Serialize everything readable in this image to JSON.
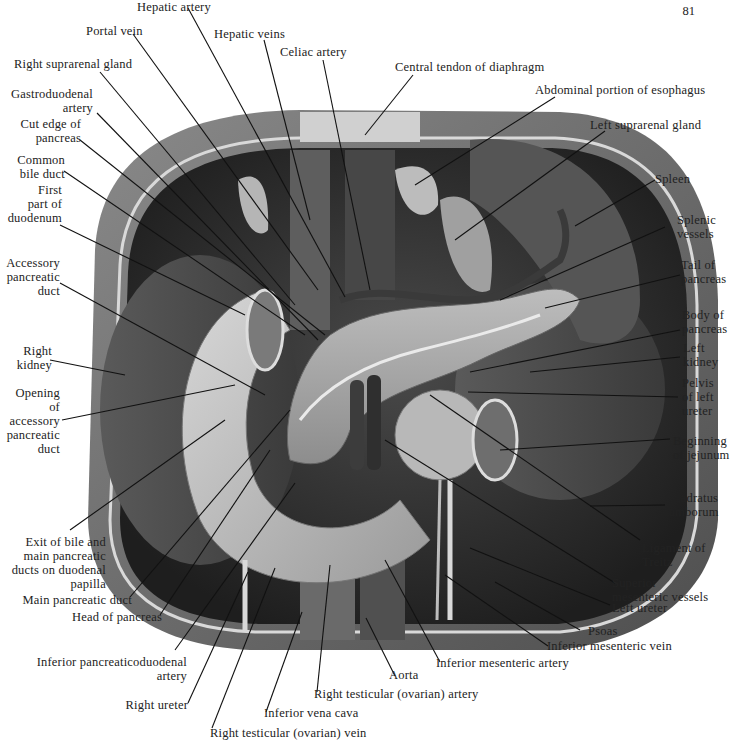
{
  "page": {
    "number": "81"
  },
  "figure": {
    "type": "anatomical-illustration",
    "colors": {
      "background": "#ffffff",
      "outer_muscle": "#6e6e6e",
      "cavity_dark": "#2e2e2e",
      "organ_mid": "#8a8a8a",
      "organ_light": "#c8c8c8",
      "leader_line": "#111111",
      "label_text": "#222222"
    }
  },
  "labels": {
    "hepatic_artery": "Hepatic artery",
    "portal_vein": "Portal vein",
    "hepatic_veins": "Hepatic veins",
    "celiac_artery": "Celiac artery",
    "right_suprarenal_gland": "Right suprarenal gland",
    "central_tendon": "Central tendon of diaphragm",
    "gastroduodenal_artery": "Gastroduodenal\nartery",
    "abdominal_esophagus": "Abdominal portion of esophagus",
    "cut_edge_pancreas": "Cut edge of\npancreas",
    "left_suprarenal_gland": "Left suprarenal gland",
    "common_bile_duct": "Common\nbile duct",
    "first_part_duodenum": "First\npart of\nduodenum",
    "spleen": "Spleen",
    "splenic_vessels": "Splenic\nvessels",
    "accessory_pancreatic_duct": "Accessory\npancreatic\nduct",
    "tail_of_pancreas": "Tail of\npancreas",
    "body_of_pancreas": "Body of\npancreas",
    "right_kidney": "Right\nkidney",
    "left_kidney": "Left\nkidney",
    "opening_accessory_duct": "Opening\nof\naccessory\npancreatic\nduct",
    "pelvis_left_ureter": "Pelvis\nof left\nureter",
    "beginning_jejunum": "Beginning\nof jejunum",
    "quadratus_lumborum": "Quadratus\nlumborum",
    "exit_bile_ducts": "Exit of bile and\nmain pancreatic\nducts on duodenal\npapilla",
    "ligament_treitz": "Ligament of\nTreitz",
    "main_pancreatic_duct": "Main pancreatic duct",
    "superior_mesenteric_vessels": "Superior\nmesenteric vessels",
    "head_of_pancreas": "Head of pancreas",
    "left_ureter": "Left ureter",
    "psoas": "Psoas",
    "inferior_mesenteric_vein": "Inferior mesenteric vein",
    "inferior_pancreaticoduodenal_artery": "Inferior pancreaticoduodenal\nartery",
    "inferior_mesenteric_artery": "Inferior mesenteric artery",
    "aorta": "Aorta",
    "right_testicular_artery": "Right testicular (ovarian) artery",
    "right_ureter": "Right ureter",
    "inferior_vena_cava": "Inferior vena cava",
    "right_testicular_vein": "Right testicular (ovarian) vein"
  }
}
